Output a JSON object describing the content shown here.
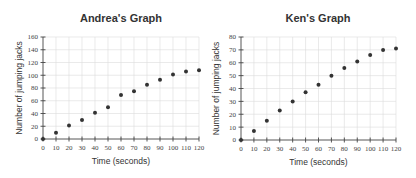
{
  "chart_data": [
    {
      "type": "scatter",
      "title": "Andrea's Graph",
      "xlabel": "Time (seconds)",
      "ylabel": "Number of jumping jacks",
      "xlim": [
        0,
        120
      ],
      "ylim": [
        0,
        160
      ],
      "xticks": [
        0,
        10,
        20,
        30,
        40,
        50,
        60,
        70,
        80,
        90,
        100,
        110,
        120
      ],
      "yticks": [
        0,
        20,
        40,
        60,
        80,
        100,
        120,
        140,
        160
      ],
      "grid": true,
      "x": [
        0,
        10,
        20,
        30,
        40,
        50,
        60,
        70,
        80,
        90,
        100,
        110,
        120
      ],
      "y": [
        0,
        10,
        21,
        30,
        41,
        50,
        69,
        75,
        85,
        93,
        101,
        106,
        108
      ]
    },
    {
      "type": "scatter",
      "title": "Ken's Graph",
      "xlabel": "Time (seconds)",
      "ylabel": "Number of jumping jacks",
      "xlim": [
        0,
        120
      ],
      "ylim": [
        0,
        80
      ],
      "xticks": [
        0,
        10,
        20,
        30,
        40,
        50,
        60,
        70,
        80,
        90,
        100,
        110,
        120
      ],
      "yticks": [
        0,
        10,
        20,
        30,
        40,
        50,
        60,
        70,
        80
      ],
      "grid": true,
      "x": [
        0,
        10,
        20,
        30,
        40,
        50,
        60,
        70,
        80,
        90,
        100,
        110,
        120
      ],
      "y": [
        0,
        7,
        15,
        23,
        30,
        37,
        43,
        50,
        56,
        61,
        66,
        70,
        71
      ]
    }
  ]
}
